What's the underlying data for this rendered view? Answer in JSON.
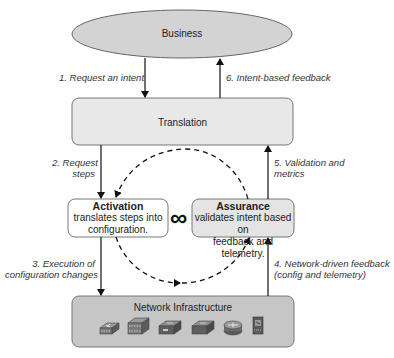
{
  "diagram": {
    "nodes": {
      "business": {
        "label": "Business"
      },
      "translation": {
        "label": "Translation"
      },
      "activation": {
        "title": "Activation",
        "desc_line1": "translates steps into",
        "desc_line2": "configuration."
      },
      "assurance": {
        "title": "Assurance",
        "desc_line1": "validates intent based on",
        "desc_line2": "feedback and telemetry."
      },
      "network": {
        "label": "Network Infrastructure",
        "devices": [
          "access-switch",
          "multilayer-switch",
          "firewall",
          "switch",
          "router",
          "server"
        ]
      }
    },
    "loop_symbol": "∞",
    "edges": {
      "e1": {
        "line1": "1. Request an intent"
      },
      "e2": {
        "line1": "2. Request",
        "line2": "steps"
      },
      "e3": {
        "line1": "3. Execution of",
        "line2": "configuration changes"
      },
      "e4": {
        "line1": "4. Network-driven feedback",
        "line2": "(config and telemetry)"
      },
      "e5": {
        "line1": "5. Validation and",
        "line2": "metrics"
      },
      "e6": {
        "line1": "6. Intent-based feedback"
      }
    },
    "colors": {
      "business_fill": "#d3d3d3",
      "translation_fill": "#e8e8e8",
      "assurance_fill": "#e4e4e4",
      "network_fill": "#c6c6c6",
      "stroke": "#555555"
    }
  }
}
